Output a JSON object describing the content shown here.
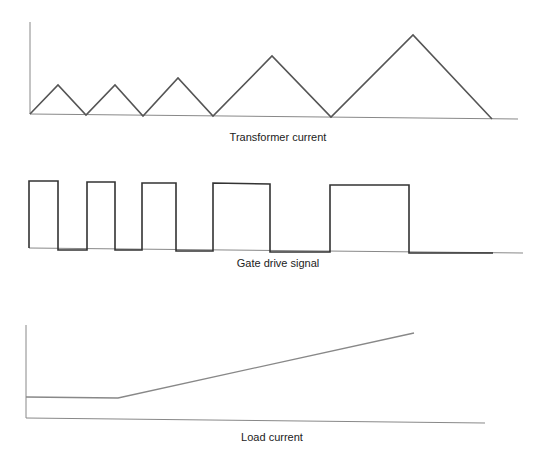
{
  "diagram": {
    "panels": [
      {
        "id": "transformer",
        "caption": "Transformer current",
        "caption_pos": [
          278,
          131
        ],
        "axis_y": [
          [
            30,
            22
          ],
          [
            30,
            114
          ]
        ],
        "axis_x": [
          [
            30,
            114
          ],
          [
            518,
            119
          ]
        ],
        "waveform": [
          [
            30,
            114
          ],
          [
            58,
            85
          ],
          [
            86,
            115
          ],
          [
            115,
            85
          ],
          [
            143,
            116
          ],
          [
            178,
            78
          ],
          [
            213,
            116
          ],
          [
            272,
            56
          ],
          [
            331,
            117
          ],
          [
            413,
            35
          ],
          [
            492,
            119
          ]
        ],
        "waveform_color": "#555555",
        "waveform_width": 1.6
      },
      {
        "id": "gate",
        "caption": "Gate drive signal",
        "caption_pos": [
          278,
          257
        ],
        "axis_y": null,
        "axis_x": [
          [
            29,
            248
          ],
          [
            523,
            253
          ]
        ],
        "waveform": [
          [
            29,
            248
          ],
          [
            29,
            181
          ],
          [
            58,
            181
          ],
          [
            58,
            250
          ],
          [
            87,
            250
          ],
          [
            87,
            182
          ],
          [
            115,
            182
          ],
          [
            115,
            250
          ],
          [
            142,
            250
          ],
          [
            142,
            183
          ],
          [
            176,
            183
          ],
          [
            176,
            251
          ],
          [
            213,
            251
          ],
          [
            213,
            183
          ],
          [
            270,
            184
          ],
          [
            270,
            252
          ],
          [
            330,
            252
          ],
          [
            330,
            185
          ],
          [
            409,
            185
          ],
          [
            409,
            253
          ],
          [
            493,
            253
          ]
        ],
        "waveform_color": "#333333",
        "waveform_width": 1.6
      },
      {
        "id": "load",
        "caption": "Load current",
        "caption_pos": [
          272,
          431
        ],
        "axis_y": [
          [
            26,
            325
          ],
          [
            26,
            418
          ]
        ],
        "axis_x": [
          [
            26,
            418
          ],
          [
            485,
            423
          ]
        ],
        "waveform": [
          [
            26,
            397
          ],
          [
            118,
            398
          ],
          [
            414,
            333
          ]
        ],
        "waveform_color": "#888888",
        "waveform_width": 1.3
      }
    ],
    "axis_color": "#888888"
  }
}
